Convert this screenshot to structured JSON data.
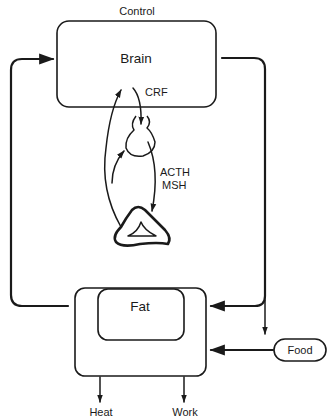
{
  "diagram": {
    "title": "Control",
    "nodes": {
      "brain": {
        "label": "Brain"
      },
      "fat": {
        "label": "Fat"
      },
      "food": {
        "label": "Food"
      }
    },
    "hormones": {
      "crf": "CRF",
      "acth": "ACTH",
      "msh": "MSH"
    },
    "outputs": {
      "heat": "Heat",
      "work": "Work"
    },
    "colors": {
      "stroke": "#1a1a1a",
      "background": "#ffffff"
    }
  }
}
